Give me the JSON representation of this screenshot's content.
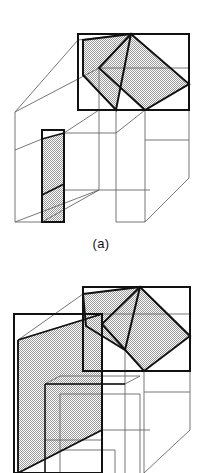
{
  "figure": {
    "kind": "line-drawing",
    "background_color": "#ffffff",
    "stroke_dark": "#111111",
    "stroke_light": "#555555",
    "fill_dither": "#bfbfbf",
    "panels": [
      {
        "id": "a",
        "caption": "(a)",
        "shaded_faces": [
          "roof-left-slope",
          "roof-right-slope",
          "door-jamb-strip"
        ],
        "bounding_rectangles": [
          "roof-bounding-rect",
          "door-jamb-bounding-rect"
        ]
      },
      {
        "id": "b",
        "caption": "",
        "shaded_faces": [
          "roof-left-slope",
          "roof-right-slope",
          "front-wall-face"
        ],
        "bounding_rectangles": [
          "roof-bounding-rect",
          "front-wall-bounding-rect"
        ]
      }
    ]
  },
  "captions": {
    "a": "(a)",
    "b": ""
  }
}
